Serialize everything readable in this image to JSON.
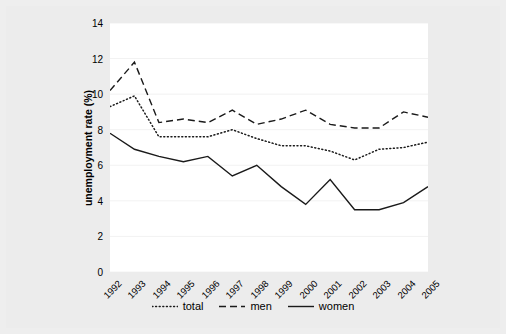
{
  "figure": {
    "background_color": "#ececec",
    "panel_color": "#ffffff",
    "line_color": "#1a1a1a",
    "grid_color": "#f2f2f2"
  },
  "legend": {
    "position": "bottom-center",
    "items": [
      {
        "label": "total",
        "style": "dotted",
        "swatch_name": "legend-swatch-total"
      },
      {
        "label": "men",
        "style": "dashed",
        "swatch_name": "legend-swatch-men"
      },
      {
        "label": "women",
        "style": "solid",
        "swatch_name": "legend-swatch-women"
      }
    ]
  },
  "chart_data": {
    "type": "line",
    "title": "",
    "xlabel": "",
    "ylabel": "unemployment rate (%)",
    "xlim": [
      1992,
      2005
    ],
    "ylim": [
      0,
      14
    ],
    "yticks": [
      0,
      2,
      4,
      6,
      8,
      10,
      12,
      14
    ],
    "grid": true,
    "grid_axis": "y",
    "categories": [
      "1992",
      "1993",
      "1994",
      "1995",
      "1996",
      "1997",
      "1998",
      "1999",
      "2000",
      "2001",
      "2002",
      "2003",
      "2004",
      "2005"
    ],
    "x": [
      1992,
      1993,
      1994,
      1995,
      1996,
      1997,
      1998,
      1999,
      2000,
      2001,
      2002,
      2003,
      2004,
      2005
    ],
    "series": [
      {
        "name": "total",
        "style": "dotted",
        "values": [
          9.3,
          9.9,
          7.6,
          7.6,
          7.6,
          8.0,
          7.5,
          7.1,
          7.1,
          6.8,
          6.3,
          6.9,
          7.0,
          7.3
        ]
      },
      {
        "name": "men",
        "style": "dashed",
        "values": [
          10.2,
          11.8,
          8.4,
          8.6,
          8.4,
          9.1,
          8.3,
          8.6,
          9.1,
          8.3,
          8.1,
          8.1,
          9.0,
          8.7
        ]
      },
      {
        "name": "women",
        "style": "solid",
        "values": [
          7.8,
          6.9,
          6.5,
          6.2,
          6.5,
          5.4,
          6.0,
          4.8,
          3.8,
          5.2,
          3.5,
          3.5,
          3.9,
          4.8
        ]
      }
    ]
  }
}
